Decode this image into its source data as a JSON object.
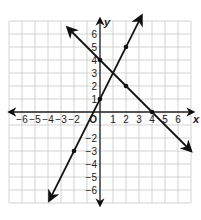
{
  "caption": "",
  "chart_data": {
    "type": "line",
    "title": "",
    "xlabel": "x",
    "ylabel": "y",
    "xlim": [
      -7,
      7
    ],
    "ylim": [
      -7,
      7
    ],
    "grid": true,
    "x_ticks": [
      -6,
      -5,
      -4,
      -3,
      -2,
      1,
      2,
      3,
      4,
      5,
      6
    ],
    "y_ticks": [
      6,
      5,
      4,
      3,
      2,
      1,
      -2,
      -3,
      -4,
      -5,
      -6
    ],
    "origin_label": "O",
    "series": [
      {
        "name": "y = 2x + 1",
        "points": [
          [
            -2,
            -3
          ],
          [
            0,
            1
          ],
          [
            2,
            5
          ]
        ],
        "extent": [
          [
            -3.9,
            -6.8
          ],
          [
            3.2,
            7.4
          ]
        ]
      },
      {
        "name": "y = -x + 4",
        "points": [
          [
            0,
            4
          ],
          [
            2,
            2
          ],
          [
            4,
            0
          ]
        ],
        "extent": [
          [
            -2.5,
            6.5
          ],
          [
            7,
            -3
          ]
        ]
      }
    ],
    "intersection": [
      1,
      3
    ]
  },
  "colors": {
    "grid": "#c8c8c8",
    "axis": "#222222",
    "line": "#111111"
  }
}
